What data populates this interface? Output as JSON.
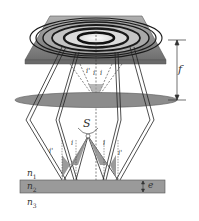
{
  "diagram": {
    "labels": {
      "focal_length": "f",
      "source": "S",
      "incidence_angle_left": "i'",
      "incidence_angle_left_inner": "i",
      "incidence_angle_right_inner": "i",
      "incidence_angle_right": "i'",
      "angle_top_left": "i'",
      "angle_top_inner_left": "i",
      "angle_top_inner_right": "i",
      "medium_1": "n",
      "medium_1_sub": "1",
      "medium_2": "n",
      "medium_2_sub": "2",
      "medium_3": "n",
      "medium_3_sub": "3",
      "thickness": "e"
    },
    "components": [
      "screen with concentric rings",
      "converging lens",
      "extended source S",
      "thin film of thickness e"
    ],
    "colors": {
      "screen": "#8a8a8a",
      "screen_edge": "#5a5a5a",
      "rings": "#1a1a1a",
      "ring_center": "#f2f2f2",
      "lens": "#8c8c8c",
      "film": "#9a9a9a",
      "rays": "#222222"
    }
  }
}
